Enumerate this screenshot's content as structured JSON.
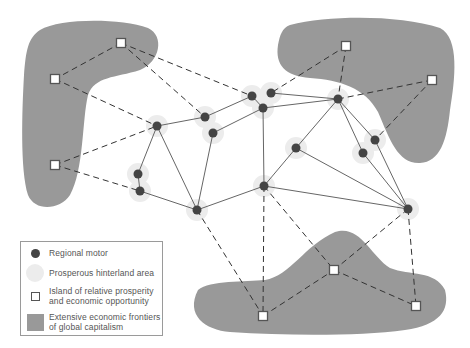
{
  "colors": {
    "frontier": "#999999",
    "hinterland": "#ececec",
    "motor": "#444444",
    "island_border": "#555555",
    "line": "#666666"
  },
  "legend": {
    "items": [
      {
        "symbol": "regional-motor",
        "label": "Regional motor"
      },
      {
        "symbol": "prosperous-hinterland",
        "label": "Prosperous hinterland area"
      },
      {
        "symbol": "island",
        "label": "Island of relative prosperity\nand economic opportunity"
      },
      {
        "symbol": "frontier",
        "label": "Extensive economic frontiers\nof global capitalism"
      }
    ]
  },
  "diagram": {
    "motors": [
      {
        "id": "A",
        "x": 157,
        "y": 126
      },
      {
        "id": "B",
        "x": 205,
        "y": 117
      },
      {
        "id": "C",
        "x": 213,
        "y": 133
      },
      {
        "id": "D",
        "x": 252,
        "y": 96
      },
      {
        "id": "E",
        "x": 271,
        "y": 93
      },
      {
        "id": "F",
        "x": 263,
        "y": 108
      },
      {
        "id": "G",
        "x": 338,
        "y": 99
      },
      {
        "id": "H",
        "x": 296,
        "y": 148
      },
      {
        "id": "I",
        "x": 375,
        "y": 140
      },
      {
        "id": "J",
        "x": 363,
        "y": 153
      },
      {
        "id": "K",
        "x": 138,
        "y": 174
      },
      {
        "id": "L",
        "x": 140,
        "y": 191
      },
      {
        "id": "M",
        "x": 197,
        "y": 210
      },
      {
        "id": "N",
        "x": 264,
        "y": 186
      },
      {
        "id": "O",
        "x": 408,
        "y": 209
      }
    ],
    "islands": [
      {
        "id": "S1",
        "x": 121,
        "y": 43
      },
      {
        "id": "S2",
        "x": 55,
        "y": 79
      },
      {
        "id": "S3",
        "x": 55,
        "y": 165
      },
      {
        "id": "S4",
        "x": 346,
        "y": 46
      },
      {
        "id": "S5",
        "x": 432,
        "y": 80
      },
      {
        "id": "S6",
        "x": 263,
        "y": 316
      },
      {
        "id": "S7",
        "x": 334,
        "y": 270
      },
      {
        "id": "S8",
        "x": 416,
        "y": 306
      }
    ],
    "solid_links": [
      [
        "A",
        "B"
      ],
      [
        "A",
        "K"
      ],
      [
        "A",
        "M"
      ],
      [
        "B",
        "D"
      ],
      [
        "C",
        "M"
      ],
      [
        "C",
        "F"
      ],
      [
        "D",
        "F"
      ],
      [
        "E",
        "G"
      ],
      [
        "F",
        "G"
      ],
      [
        "F",
        "N"
      ],
      [
        "G",
        "H"
      ],
      [
        "G",
        "I"
      ],
      [
        "G",
        "J"
      ],
      [
        "H",
        "N"
      ],
      [
        "H",
        "O"
      ],
      [
        "I",
        "O"
      ],
      [
        "J",
        "O"
      ],
      [
        "N",
        "O"
      ],
      [
        "N",
        "M"
      ],
      [
        "L",
        "M"
      ],
      [
        "K",
        "L"
      ]
    ],
    "dashed_links": [
      [
        "S1",
        "S2"
      ],
      [
        "S1",
        "D"
      ],
      [
        "S1",
        "B"
      ],
      [
        "S2",
        "A"
      ],
      [
        "S3",
        "A"
      ],
      [
        "S3",
        "L"
      ],
      [
        "S4",
        "E"
      ],
      [
        "S4",
        "G"
      ],
      [
        "S5",
        "G"
      ],
      [
        "S5",
        "I"
      ],
      [
        "M",
        "S6"
      ],
      [
        "N",
        "S6"
      ],
      [
        "N",
        "S7"
      ],
      [
        "O",
        "S7"
      ],
      [
        "O",
        "S8"
      ],
      [
        "S6",
        "S7"
      ],
      [
        "S7",
        "S8"
      ]
    ]
  }
}
